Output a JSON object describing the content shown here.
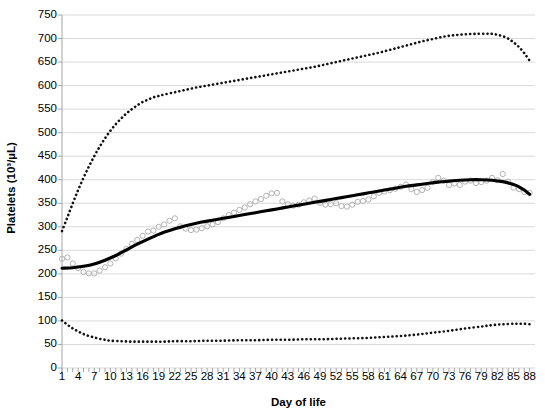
{
  "chart_data": {
    "type": "line",
    "title": "",
    "xlabel": "Day of life",
    "ylabel": "Platelets (10³/µL)",
    "xlim": [
      1,
      89
    ],
    "ylim": [
      0,
      750
    ],
    "yticks": [
      0,
      50,
      100,
      150,
      200,
      250,
      300,
      350,
      400,
      450,
      500,
      550,
      600,
      650,
      700,
      750
    ],
    "xticks": [
      1,
      4,
      7,
      10,
      13,
      16,
      19,
      22,
      25,
      28,
      31,
      34,
      37,
      40,
      43,
      46,
      49,
      52,
      55,
      58,
      61,
      64,
      67,
      70,
      73,
      76,
      79,
      82,
      85,
      88
    ],
    "grid": "horizontal",
    "legend": "none",
    "series": [
      {
        "name": "upper-percentile-curve",
        "style": "dotted",
        "color": "#111111",
        "x": [
          1,
          2,
          3,
          4,
          5,
          6,
          7,
          8,
          9,
          10,
          11,
          12,
          13,
          14,
          15,
          16,
          17,
          18,
          19,
          20,
          22,
          24,
          26,
          28,
          30,
          32,
          34,
          36,
          38,
          40,
          42,
          44,
          46,
          48,
          50,
          52,
          54,
          56,
          58,
          60,
          62,
          64,
          66,
          68,
          70,
          72,
          74,
          76,
          78,
          80,
          81,
          82,
          83,
          84,
          85,
          86,
          87,
          88
        ],
        "values": [
          291,
          320,
          350,
          378,
          404,
          428,
          450,
          470,
          488,
          504,
          518,
          530,
          541,
          550,
          558,
          565,
          570,
          575,
          578,
          581,
          586,
          591,
          596,
          600,
          604,
          608,
          612,
          616,
          620,
          624,
          628,
          632,
          636,
          640,
          645,
          650,
          655,
          660,
          665,
          670,
          676,
          682,
          688,
          694,
          699,
          704,
          707,
          709,
          710,
          710,
          710,
          708,
          705,
          700,
          692,
          682,
          669,
          653
        ]
      },
      {
        "name": "median-trend-curve",
        "style": "solid",
        "color": "#000000",
        "x": [
          1,
          3,
          5,
          7,
          9,
          11,
          13,
          15,
          17,
          19,
          21,
          23,
          25,
          27,
          29,
          31,
          33,
          35,
          37,
          39,
          41,
          43,
          45,
          47,
          49,
          51,
          53,
          55,
          57,
          59,
          61,
          63,
          65,
          67,
          69,
          71,
          73,
          75,
          77,
          79,
          81,
          83,
          85,
          86,
          87,
          88
        ],
        "values": [
          212,
          213,
          216,
          221,
          229,
          239,
          251,
          263,
          274,
          284,
          292,
          299,
          305,
          310,
          314,
          318,
          322,
          326,
          330,
          334,
          338,
          342,
          346,
          350,
          354,
          358,
          362,
          366,
          370,
          374,
          378,
          382,
          386,
          389,
          392,
          395,
          397,
          399,
          400,
          400,
          399,
          396,
          390,
          385,
          378,
          369
        ]
      },
      {
        "name": "lower-percentile-curve",
        "style": "dotted",
        "color": "#111111",
        "x": [
          1,
          2,
          3,
          4,
          5,
          6,
          7,
          8,
          9,
          10,
          12,
          14,
          16,
          18,
          20,
          22,
          25,
          28,
          31,
          34,
          37,
          40,
          43,
          46,
          49,
          52,
          55,
          58,
          61,
          64,
          67,
          70,
          73,
          76,
          79,
          81,
          83,
          85,
          86,
          87,
          88
        ],
        "values": [
          101,
          92,
          84,
          78,
          72,
          68,
          65,
          62,
          60,
          58,
          57,
          56,
          56,
          56,
          56,
          57,
          57,
          58,
          58,
          59,
          59,
          60,
          60,
          61,
          61,
          62,
          63,
          64,
          66,
          68,
          71,
          75,
          79,
          84,
          88,
          91,
          93,
          94,
          94,
          94,
          93
        ]
      },
      {
        "name": "observed-means-scatter",
        "style": "open-circle",
        "color": "#b3b3b3",
        "x": [
          1,
          2,
          3,
          4,
          5,
          6,
          7,
          8,
          9,
          10,
          11,
          12,
          13,
          14,
          15,
          16,
          17,
          18,
          19,
          20,
          21,
          22,
          23,
          24,
          25,
          26,
          27,
          28,
          29,
          30,
          31,
          32,
          33,
          34,
          35,
          36,
          37,
          38,
          39,
          40,
          41,
          42,
          43,
          44,
          45,
          46,
          47,
          48,
          49,
          50,
          51,
          52,
          53,
          54,
          55,
          56,
          57,
          58,
          59,
          60,
          61,
          62,
          63,
          64,
          65,
          66,
          67,
          68,
          69,
          70,
          71,
          72,
          73,
          74,
          75,
          76,
          77,
          78,
          79,
          80,
          81,
          82,
          83,
          84,
          85,
          86,
          87,
          88
        ],
        "values": [
          232,
          235,
          222,
          212,
          204,
          201,
          201,
          207,
          214,
          222,
          233,
          243,
          253,
          264,
          272,
          281,
          290,
          292,
          300,
          305,
          313,
          318,
          301,
          296,
          293,
          294,
          297,
          301,
          305,
          310,
          318,
          325,
          330,
          336,
          341,
          348,
          354,
          359,
          366,
          371,
          372,
          354,
          348,
          345,
          347,
          352,
          356,
          360,
          351,
          347,
          348,
          350,
          344,
          343,
          347,
          353,
          355,
          358,
          365,
          372,
          375,
          378,
          381,
          385,
          390,
          380,
          374,
          378,
          383,
          395,
          404,
          398,
          389,
          392,
          389,
          396,
          398,
          393,
          395,
          398,
          404,
          399,
          412,
          396,
          383,
          380,
          374,
          372
        ]
      }
    ]
  },
  "axes": {
    "x_title": "Day of life",
    "y_title": "Platelets (10³/µL)"
  },
  "colors": {
    "grid": "#d9d9d9",
    "axis": "#a6a6a6",
    "line": "#000000",
    "marker": "#b3b3b3",
    "background": "#ffffff"
  }
}
